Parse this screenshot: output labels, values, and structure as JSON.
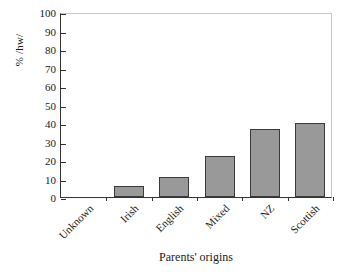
{
  "chart_data": {
    "type": "bar",
    "title": "",
    "subtitle": "",
    "categories": [
      "Unknown",
      "Irish",
      "English",
      "Mixed",
      "NZ",
      "Scottish"
    ],
    "values": [
      0,
      6,
      11,
      22,
      37,
      40
    ],
    "xlabel": "Parents' origins",
    "ylabel": "% /hw/",
    "ylim": [
      0,
      100
    ],
    "yticks": [
      0,
      10,
      20,
      30,
      40,
      50,
      60,
      70,
      80,
      90,
      100
    ],
    "ytick_labels": [
      "0",
      "10",
      "20",
      "30",
      "40",
      "50",
      "60",
      "70",
      "80",
      "90",
      "100"
    ],
    "grid": false,
    "legend": null,
    "legend_position": "none",
    "bar_color": "#999999",
    "bar_edge_color": "#3a3a3a",
    "axis_color": "#333333",
    "frame_color": "#c8c8c8",
    "background": "#ffffff",
    "xtick_label_rotation": 45,
    "annotations": []
  }
}
